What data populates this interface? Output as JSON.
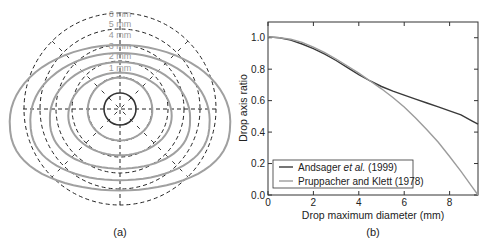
{
  "chart_data": [
    {
      "type": "diagram",
      "panel_label": "(a)",
      "description": "Cross-sections of raindrop shapes for equivolume diameters 1-6 mm (solid gray) overlaid on equivalent spheres (dashed circles)",
      "drops": [
        {
          "label": "1 mm",
          "diameter_mm": 1,
          "axis_ratio": 1.0
        },
        {
          "label": "2 mm",
          "diameter_mm": 2,
          "axis_ratio": 0.97
        },
        {
          "label": "3 mm",
          "diameter_mm": 3,
          "axis_ratio": 0.8
        },
        {
          "label": "4 mm",
          "diameter_mm": 4,
          "axis_ratio": 0.76
        },
        {
          "label": "5 mm",
          "diameter_mm": 5,
          "axis_ratio": 0.71
        },
        {
          "label": "6 mm",
          "diameter_mm": 6,
          "axis_ratio": 0.66
        }
      ],
      "colors": {
        "drop": "#a0a0a0",
        "sphere": "#222222",
        "label": "#9a9a9a"
      }
    },
    {
      "type": "line",
      "panel_label": "(b)",
      "title": "",
      "xlabel": "Drop maximum diameter (mm)",
      "ylabel": "Drop axis ratio",
      "xlim": [
        0,
        9.25
      ],
      "ylim": [
        0,
        1.1
      ],
      "xticks": [
        0,
        2,
        4,
        6,
        8
      ],
      "yticks": [
        0.0,
        0.2,
        0.4,
        0.6,
        0.8,
        1.0
      ],
      "ytick_labels": [
        "0.0",
        "0.2",
        "0.4",
        "0.6",
        "0.8",
        "1.0"
      ],
      "grid": false,
      "legend_position": "bottom-left",
      "series": [
        {
          "name": "Andsager et al. (1999)",
          "name_parts": [
            "Andsager ",
            "et al.",
            " (1999)"
          ],
          "color": "#3a3a3a",
          "x": [
            0,
            0.5,
            1,
            1.5,
            2,
            2.5,
            3,
            3.5,
            4,
            4.5,
            5,
            5.5,
            6,
            6.5,
            7,
            7.5,
            8,
            8.5,
            9,
            9.25
          ],
          "y": [
            1.005,
            1.0,
            0.985,
            0.96,
            0.93,
            0.895,
            0.855,
            0.81,
            0.765,
            0.725,
            0.69,
            0.66,
            0.635,
            0.61,
            0.585,
            0.56,
            0.535,
            0.51,
            0.47,
            0.45
          ]
        },
        {
          "name": "Pruppacher and Klett (1978)",
          "name_parts": [
            "Pruppacher and Klett (1978)",
            "",
            ""
          ],
          "color": "#9c9c9c",
          "x": [
            0,
            0.5,
            1,
            1.5,
            2,
            2.5,
            3,
            3.5,
            4,
            4.5,
            5,
            5.5,
            6,
            6.5,
            7,
            7.5,
            8,
            8.5,
            9,
            9.25
          ],
          "y": [
            1.005,
            1.0,
            0.99,
            0.97,
            0.94,
            0.905,
            0.865,
            0.82,
            0.775,
            0.725,
            0.675,
            0.62,
            0.56,
            0.49,
            0.415,
            0.335,
            0.245,
            0.15,
            0.05,
            0.0
          ]
        }
      ]
    }
  ]
}
